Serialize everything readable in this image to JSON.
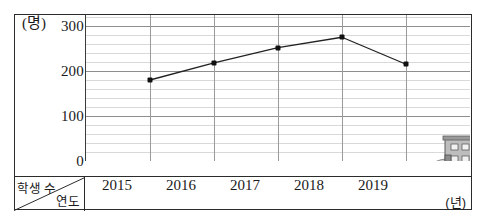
{
  "chart_data": {
    "type": "line",
    "title": "",
    "xlabel": "연도",
    "ylabel": "학생 수",
    "x_unit": "(년)",
    "y_unit": "(명)",
    "categories": [
      "2015",
      "2016",
      "2017",
      "2018",
      "2019"
    ],
    "values": [
      180,
      218,
      252,
      275,
      215
    ],
    "series": [
      {
        "name": "학생 수",
        "values": [
          180,
          218,
          252,
          275,
          215
        ]
      }
    ],
    "ylim": [
      0,
      320
    ],
    "yticks": [
      0,
      100,
      200,
      300
    ],
    "ytick_labels": [
      "0",
      "100",
      "200",
      "300"
    ],
    "minor_step": 20,
    "grid": true,
    "legend": false,
    "marker": "filled-square",
    "line_color": "#222222",
    "grid_color": "#d9d9d9",
    "major_grid_color": "#8e8e8e"
  },
  "axes": {
    "y_unit_label": "(명)",
    "x_unit_label": "(년)",
    "corner": {
      "row_label": "학생 수",
      "col_label": "연도"
    }
  },
  "decoration": {
    "illustration_name": "school-building-illustration",
    "flag": "flag-icon",
    "clock": "clock-icon"
  },
  "colors": {
    "frame": "#2b2b2b",
    "ink": "#1a1a1a",
    "grid_minor": "#d9d9d9",
    "grid_major": "#8e8e8e",
    "building_wall": "#b9b9b9",
    "building_dark": "#6f6f6f",
    "bush": "#c9c9c9"
  }
}
